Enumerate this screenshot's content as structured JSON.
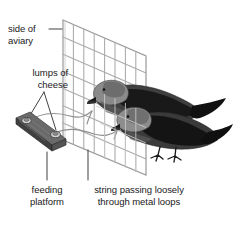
{
  "figure": {
    "kind": "scientific-illustration",
    "background_color": "#ffffff",
    "ink_color": "#1a1a1a",
    "mesh_color": "#a8a8a8",
    "string_color": "#8c8c8c",
    "platform_color": "#4a4a4a",
    "bird_dark_color": "#151515",
    "bird_mid_color": "#555555",
    "bird_light_color": "#8e8e8e"
  },
  "labels": {
    "side_of_aviary": "side of\naviary",
    "lumps_of_cheese": "lumps of\ncheese",
    "feeding_platform": "feeding\nplatform",
    "string_through_loops": "string passing loosely\nthrough metal loops"
  },
  "annotations": {
    "leader_side_of_aviary": "horizontal line from text to mesh edge",
    "leader_lumps_of_cheese": "v-shaped lines from text to two cheese lumps",
    "leader_feeding_platform": "vertical line from caption to platform",
    "leader_string_loops": "vertical line from caption to string"
  },
  "elements": [
    "aviary-mesh",
    "feeding-platform",
    "cheese-lump-upper",
    "cheese-lump-lower",
    "string-upper",
    "string-lower",
    "crow-upper",
    "crow-lower"
  ]
}
